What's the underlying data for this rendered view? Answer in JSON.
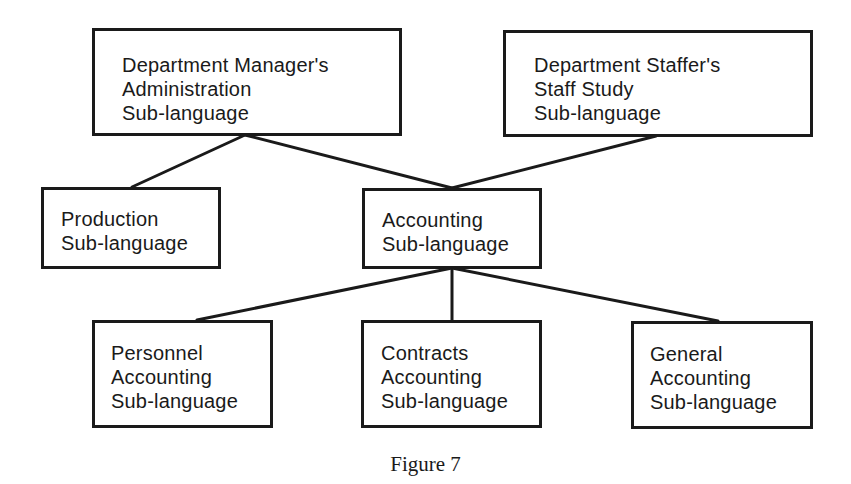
{
  "colors": {
    "stroke": "#1a1a1a",
    "background": "#ffffff"
  },
  "nodes": {
    "manager": {
      "lines": [
        "Department Manager's",
        "Administration",
        "Sub-language"
      ]
    },
    "staffer": {
      "lines": [
        "Department Staffer's",
        "Staff Study",
        "Sub-language"
      ]
    },
    "production": {
      "lines": [
        "Production",
        "Sub-language"
      ]
    },
    "accounting": {
      "lines": [
        "Accounting",
        "Sub-language"
      ]
    },
    "personnel": {
      "lines": [
        "Personnel",
        "Accounting",
        "Sub-language"
      ]
    },
    "contracts": {
      "lines": [
        "Contracts",
        "Accounting",
        "Sub-language"
      ]
    },
    "general": {
      "lines": [
        "General",
        "Accounting",
        "Sub-language"
      ]
    }
  },
  "edges": [
    {
      "from": "manager",
      "to": "production"
    },
    {
      "from": "manager",
      "to": "accounting"
    },
    {
      "from": "staffer",
      "to": "accounting"
    },
    {
      "from": "accounting",
      "to": "personnel"
    },
    {
      "from": "accounting",
      "to": "contracts"
    },
    {
      "from": "accounting",
      "to": "general"
    }
  ],
  "caption": "Figure 7"
}
